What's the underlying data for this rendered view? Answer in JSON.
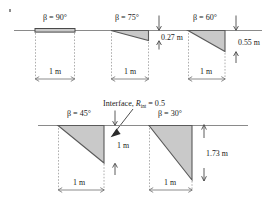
{
  "figure": {
    "title_note": "Interface element shapes for varying wall inclination angle beta",
    "interface_label": "Interface, ",
    "interface_symbol": "R",
    "interface_subscript": "int",
    "interface_equals": " = 0.5",
    "ground_color": "#8a8a8a",
    "fill_color": "#c9c9c9",
    "outline_color": "#5a5a5a",
    "background_color": "#ffffff"
  },
  "cases": [
    {
      "id": "beta-90",
      "beta_label": "β = 90°",
      "beta_degrees": 90,
      "width_label": "1 m",
      "width_m": 1,
      "depth_label": "",
      "depth_m": 0,
      "shape": "bar",
      "has_depth_dim": false
    },
    {
      "id": "beta-75",
      "beta_label": "β = 75°",
      "beta_degrees": 75,
      "width_label": "1 m",
      "width_m": 1,
      "depth_label": "0.27 m",
      "depth_m": 0.27,
      "shape": "triangle",
      "has_depth_dim": true
    },
    {
      "id": "beta-60",
      "beta_label": "β = 60°",
      "beta_degrees": 60,
      "width_label": "1 m",
      "width_m": 1,
      "depth_label": "0.55 m",
      "depth_m": 0.55,
      "shape": "triangle",
      "has_depth_dim": true
    },
    {
      "id": "beta-45",
      "beta_label": "β = 45°",
      "beta_degrees": 45,
      "width_label": "1 m",
      "width_m": 1,
      "depth_label": "1 m",
      "depth_m": 1.0,
      "shape": "triangle",
      "has_depth_dim": true
    },
    {
      "id": "beta-30",
      "beta_label": "β = 30°",
      "beta_degrees": 30,
      "width_label": "1 m",
      "width_m": 1,
      "depth_label": "1.73 m",
      "depth_m": 1.73,
      "shape": "triangle",
      "has_depth_dim": true
    }
  ]
}
